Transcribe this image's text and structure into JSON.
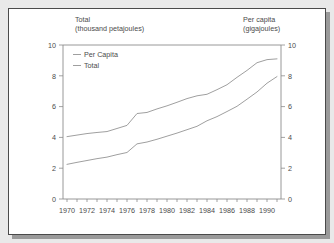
{
  "chart_data": {
    "type": "line",
    "title": "",
    "subtitle": "",
    "left_axis": {
      "label_line1": "Total",
      "label_line2": "(thousand petajoules)",
      "ticks": [
        "0",
        "2",
        "4",
        "6",
        "8",
        "10"
      ],
      "lim": [
        0,
        10
      ]
    },
    "right_axis": {
      "label_line1": "Per capita",
      "label_line2": "(gigajoules)",
      "ticks": [
        "0",
        "2",
        "4",
        "6",
        "8",
        "10"
      ],
      "lim": [
        0,
        10
      ]
    },
    "xlabel": "",
    "ylabel": "",
    "grid": false,
    "legend_position": "top-left",
    "x": [
      1970,
      1971,
      1972,
      1973,
      1974,
      1975,
      1976,
      1977,
      1978,
      1979,
      1980,
      1981,
      1982,
      1983,
      1984,
      1985,
      1986,
      1987,
      1988,
      1989,
      1990,
      1991
    ],
    "xlim": [
      1969.6,
      1991.4
    ],
    "x_tick_labels": [
      "1970",
      "1972",
      "1974",
      "1976",
      "1978",
      "1980",
      "1982",
      "1984",
      "1986",
      "1988",
      "1990"
    ],
    "x_tick_values": [
      1970,
      1972,
      1974,
      1976,
      1978,
      1980,
      1982,
      1984,
      1986,
      1988,
      1990
    ],
    "x_minor_ticks": [
      1971,
      1973,
      1975,
      1977,
      1979,
      1981,
      1983,
      1985,
      1987,
      1989,
      1991
    ],
    "series": [
      {
        "name": "Per Capita",
        "axis": "right",
        "color": "#9a9a9a",
        "values": [
          4.05,
          4.15,
          4.25,
          4.32,
          4.38,
          4.58,
          4.78,
          5.55,
          5.62,
          5.85,
          6.05,
          6.28,
          6.52,
          6.7,
          6.8,
          7.1,
          7.42,
          7.9,
          8.35,
          8.85,
          9.05,
          9.1
        ]
      },
      {
        "name": "Total",
        "axis": "left",
        "color": "#9a9a9a",
        "values": [
          2.25,
          2.38,
          2.5,
          2.62,
          2.72,
          2.88,
          3.02,
          3.58,
          3.7,
          3.88,
          4.08,
          4.28,
          4.5,
          4.72,
          5.08,
          5.35,
          5.68,
          6.02,
          6.48,
          6.95,
          7.52,
          7.95
        ]
      }
    ],
    "legend": [
      {
        "label": "Per Capita"
      },
      {
        "label": "Total"
      }
    ],
    "colors": {
      "line": "#9a9a9a",
      "axis": "#8c8c8c",
      "text": "#4b4b4b",
      "frame": "#4a4a4a",
      "page_background": "#e9e9e9",
      "card_background": "#ffffff",
      "shadow": "#9a9a9a"
    }
  }
}
